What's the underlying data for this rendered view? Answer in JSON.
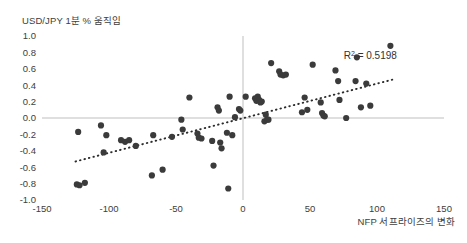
{
  "chart_data": {
    "type": "scatter",
    "title": "",
    "ylabel": "USD/JPY 1분 % 움직임",
    "xlabel": "NFP 서프라이즈의 변화",
    "xlim": [
      -150,
      150
    ],
    "ylim": [
      -1.0,
      1.0
    ],
    "xticks": [
      "-150",
      "-100",
      "-50",
      "0",
      "50",
      "100",
      "150"
    ],
    "xtick_values": [
      -150,
      -100,
      -50,
      0,
      50,
      100,
      150
    ],
    "yticks": [
      "1.0",
      "0.8",
      "0.6",
      "0.4",
      "0.2",
      "0.0",
      "-0.2",
      "-0.4",
      "-0.6",
      "-0.8",
      "-1.0"
    ],
    "ytick_values": [
      1.0,
      0.8,
      0.6,
      0.4,
      0.2,
      0.0,
      -0.2,
      -0.4,
      -0.6,
      -0.8,
      -1.0
    ],
    "grid": false,
    "legend": "none",
    "annotations": [
      {
        "text": "R² = 0.5198",
        "x": 95,
        "y": 0.72
      }
    ],
    "r_squared": 0.5198,
    "marker_color": "#3b3b3b",
    "axis_color": "#bfbfbf",
    "trendline": {
      "style": "dotted",
      "color": "#2b2b2b",
      "x_start": -125,
      "y_start": -0.53,
      "x_end": 112,
      "y_end": 0.47
    },
    "series": [
      {
        "name": "NFP surprise vs USD/JPY move",
        "points": [
          [
            -123,
            -0.17
          ],
          [
            -124,
            -0.81
          ],
          [
            -122,
            -0.82
          ],
          [
            -118,
            -0.79
          ],
          [
            -106,
            -0.09
          ],
          [
            -104,
            -0.42
          ],
          [
            -102,
            -0.21
          ],
          [
            -91,
            -0.27
          ],
          [
            -88,
            -0.29
          ],
          [
            -85,
            -0.27
          ],
          [
            -80,
            -0.34
          ],
          [
            -68,
            -0.7
          ],
          [
            -67,
            -0.21
          ],
          [
            -60,
            -0.63
          ],
          [
            -53,
            -0.23
          ],
          [
            -46,
            -0.02
          ],
          [
            -45,
            -0.14
          ],
          [
            -40,
            0.25
          ],
          [
            -34,
            -0.19
          ],
          [
            -33,
            -0.24
          ],
          [
            -31,
            -0.25
          ],
          [
            -23,
            -0.28
          ],
          [
            -22,
            -0.58
          ],
          [
            -19,
            0.13
          ],
          [
            -18,
            0.09
          ],
          [
            -17,
            -0.3
          ],
          [
            -16,
            -0.37
          ],
          [
            -12,
            -0.18
          ],
          [
            -11,
            -0.86
          ],
          [
            -10,
            0.26
          ],
          [
            -8,
            -0.21
          ],
          [
            -6,
            0.01
          ],
          [
            -3,
            0.11
          ],
          [
            -2,
            0.09
          ],
          [
            2,
            0.26
          ],
          [
            9,
            0.24
          ],
          [
            10,
            0.21
          ],
          [
            11,
            0.26
          ],
          [
            12,
            0.22
          ],
          [
            13,
            0.19
          ],
          [
            14,
            0.2
          ],
          [
            16,
            -0.04
          ],
          [
            17,
            0.04
          ],
          [
            18,
            -0.02
          ],
          [
            19,
            -0.02
          ],
          [
            21,
            0.67
          ],
          [
            27,
            0.57
          ],
          [
            28,
            0.53
          ],
          [
            30,
            0.52
          ],
          [
            32,
            0.53
          ],
          [
            44,
            0.07
          ],
          [
            46,
            0.25
          ],
          [
            48,
            0.1
          ],
          [
            52,
            0.65
          ],
          [
            58,
            0.19
          ],
          [
            59,
            0.06
          ],
          [
            60,
            0.03
          ],
          [
            61,
            0.02
          ],
          [
            69,
            0.58
          ],
          [
            71,
            0.45
          ],
          [
            72,
            0.22
          ],
          [
            77,
            0.0
          ],
          [
            84,
            0.45
          ],
          [
            85,
            0.74
          ],
          [
            88,
            0.13
          ],
          [
            92,
            0.42
          ],
          [
            95,
            0.15
          ],
          [
            110,
            0.88
          ]
        ]
      }
    ]
  }
}
